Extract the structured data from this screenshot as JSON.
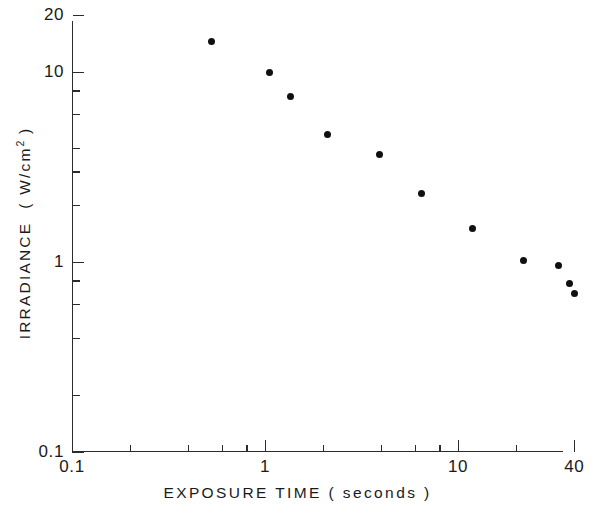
{
  "figure": {
    "background_color": "#ffffff",
    "ink_color": "#1a1a1a",
    "marker_color": "#101010"
  },
  "chart_data": {
    "type": "scatter",
    "title": "",
    "subtitle": "",
    "xlabel": "EXPOSURE  TIME  ( seconds )",
    "ylabel": "IRRADIANCE  ( W/cm2 )",
    "ylabel_parts": {
      "lead": "IRRADIANCE",
      "open": "(",
      "units_base": "W/cm",
      "units_exponent": "2",
      "close": ")"
    },
    "xscale": "log",
    "yscale": "log",
    "xlim": [
      0.1,
      40
    ],
    "ylim": [
      0.1,
      20
    ],
    "grid": false,
    "legend": null,
    "xticks_major": [
      0.1,
      1,
      10,
      40
    ],
    "xtick_labels": [
      "0.1",
      "1",
      "10",
      "40"
    ],
    "xticks_minor": [
      0.2,
      0.4,
      0.6,
      0.8,
      2,
      4,
      6,
      8,
      20
    ],
    "yticks_major": [
      0.1,
      1,
      10,
      20
    ],
    "ytick_labels": [
      "0.1",
      "1",
      "10",
      "20"
    ],
    "yticks_minor": [
      0.2,
      0.4,
      0.6,
      0.8,
      2,
      3,
      4,
      6,
      8
    ],
    "series": [
      {
        "name": "threshold irradiance",
        "marker": "filled-circle",
        "x": [
          0.53,
          1.05,
          1.36,
          2.1,
          3.9,
          6.5,
          11.9,
          21.9,
          33.0,
          38.0,
          40.0
        ],
        "y": [
          14.5,
          9.9,
          7.4,
          4.7,
          3.7,
          2.3,
          1.5,
          1.02,
          0.96,
          0.77,
          0.68
        ]
      }
    ]
  }
}
